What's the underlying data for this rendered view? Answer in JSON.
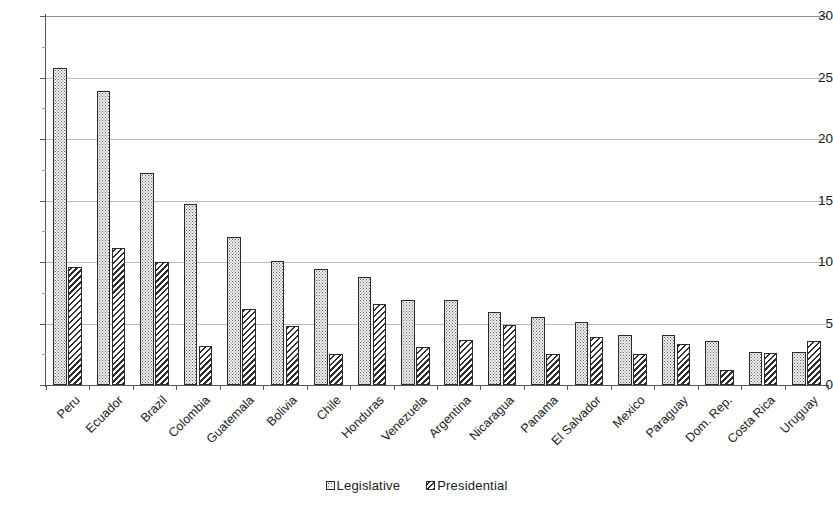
{
  "chart_data": {
    "type": "bar",
    "title": "",
    "subtitle": "",
    "xlabel": "",
    "ylabel": "",
    "ylim": [
      0,
      30
    ],
    "ytick_labels": [
      "0",
      "5",
      "10",
      "15",
      "20",
      "25",
      "30"
    ],
    "ytick_values": [
      0,
      5,
      10,
      15,
      20,
      25,
      30
    ],
    "grid": true,
    "grid_axis": "y",
    "legend_position": "bottom-center",
    "categories": [
      "Peru",
      "Ecuador",
      "Brazil",
      "Colombia",
      "Guatemala",
      "Bolivia",
      "Chile",
      "Honduras",
      "Venezuela",
      "Argentina",
      "Nicaragua",
      "Panama",
      "El Salvador",
      "Mexico",
      "Paraguay",
      "Dom. Rep.",
      "Costa Rica",
      "Uruguay"
    ],
    "series": [
      {
        "name": "Legislative",
        "pattern": "light-dotted",
        "color": "#f4f4f4",
        "values": [
          25.8,
          23.9,
          17.2,
          14.7,
          12.0,
          10.1,
          9.4,
          8.8,
          6.9,
          6.9,
          5.9,
          5.5,
          5.1,
          4.1,
          4.1,
          3.6,
          2.7,
          2.7
        ]
      },
      {
        "name": "Presidential",
        "pattern": "dark-diagonal-hatch",
        "color": "#2f2f2f",
        "values": [
          9.6,
          11.1,
          10.0,
          3.2,
          6.2,
          4.8,
          2.5,
          6.6,
          3.1,
          3.7,
          4.9,
          2.5,
          3.9,
          2.5,
          3.3,
          1.2,
          2.6,
          3.6
        ]
      }
    ]
  },
  "legend": {
    "items": [
      {
        "label": "Legislative"
      },
      {
        "label": "Presidential"
      }
    ]
  }
}
